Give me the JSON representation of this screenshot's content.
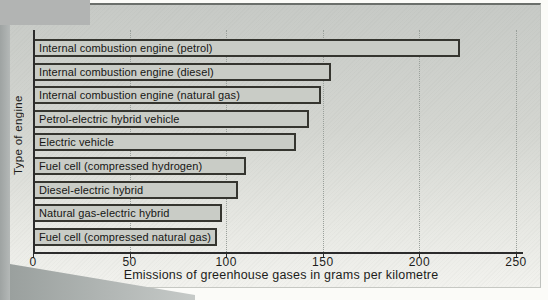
{
  "chart_data": {
    "type": "bar",
    "orientation": "horizontal",
    "xlabel": "Emissions of greenhouse gases in grams per kilometre",
    "ylabel": "Type of engine",
    "xlim": [
      0,
      250
    ],
    "x_ticks": [
      "0",
      "50",
      "100",
      "150",
      "200",
      "250"
    ],
    "x_tick_values": [
      0,
      50,
      100,
      150,
      200,
      250
    ],
    "grid": "vertical dotted gridlines at each tick, no horizontal grid",
    "legend": "none",
    "bar_label_position": "inside-left",
    "categories": [
      "Internal combustion engine (petrol)",
      "Internal combustion engine (diesel)",
      "Internal combustion engine (natural gas)",
      "Petrol-electric hybrid vehicle",
      "Electric vehicle",
      "Fuel cell (compressed hydrogen)",
      "Diesel-electric hybrid",
      "Natural gas-electric hybrid",
      "Fuel cell (compressed natural gas)"
    ],
    "values": [
      220,
      153,
      148,
      142,
      135,
      109,
      105,
      97,
      94
    ]
  },
  "colors": {
    "bar_fill": "#c9ccc6",
    "bar_border": "#35352f",
    "axis": "#2b2b2b",
    "gridline": "#9aa09b",
    "text": "#1d1d1b",
    "panel_top": "#c7cac6",
    "panel_bottom": "#f2f2ee",
    "scan_gray": "#b2b4b3"
  }
}
